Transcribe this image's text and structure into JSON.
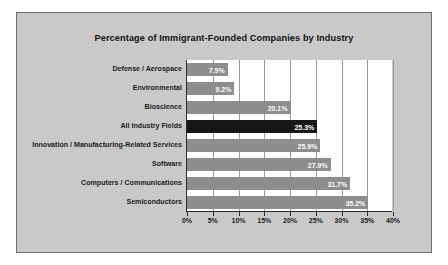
{
  "chart_data": {
    "type": "bar",
    "orientation": "horizontal",
    "title": "Percentage of Immigrant-Founded Companies by Industry",
    "xlabel": "",
    "ylabel": "",
    "xlim": [
      0,
      40
    ],
    "xtick_labels": [
      "0%",
      "5%",
      "10%",
      "15%",
      "20%",
      "25%",
      "30%",
      "35%",
      "40%"
    ],
    "xticks": [
      0,
      5,
      10,
      15,
      20,
      25,
      30,
      35,
      40
    ],
    "grid": true,
    "legend": "none",
    "categories": [
      "Defense / Aerospace",
      "Environmental",
      "Bioscience",
      "All Industry Fields",
      "Innovation / Manufacturing-Related Services",
      "Software",
      "Computers / Communications",
      "Semiconductors"
    ],
    "values": [
      7.9,
      9.2,
      20.1,
      25.3,
      25.9,
      27.9,
      31.7,
      35.2
    ],
    "value_labels": [
      "7.9%",
      "9.2%",
      "20.1%",
      "25.3%",
      "25.9%",
      "27.9%",
      "31.7%",
      "35.2%"
    ],
    "highlight_index": 3,
    "colors": {
      "bar": "#8d8d8d",
      "bar_highlight": "#171717",
      "plot_background": "#ffffff",
      "panel_background": "#c9c9c9",
      "gridline": "#9a9a9a",
      "axis": "#2b2b2b",
      "text": "#1b1b1b",
      "value_label": "#ffffff"
    }
  }
}
